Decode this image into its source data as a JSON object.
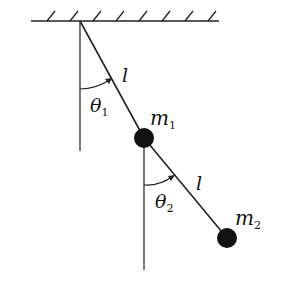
{
  "figure": {
    "colors": {
      "line": "#222222",
      "mass": "#111111",
      "background": "#ffffff"
    },
    "ceiling": {
      "x1": 31,
      "x2": 219,
      "y": 21,
      "hatch_x": [
        47,
        70,
        93,
        116,
        139,
        162,
        185,
        208
      ]
    },
    "pivot": {
      "x": 80,
      "y": 21
    },
    "mass1": {
      "x": 144,
      "y": 138,
      "r": 10
    },
    "mass2": {
      "x": 227,
      "y": 238,
      "r": 10
    },
    "reference_line1": {
      "x": 80,
      "y1": 21,
      "y2": 151
    },
    "reference_line2": {
      "x": 144,
      "y1": 138,
      "y2": 270
    }
  },
  "labels": {
    "length1": "l",
    "length2": "l",
    "theta1_symbol": "θ",
    "theta1_sub": "1",
    "theta2_symbol": "θ",
    "theta2_sub": "2",
    "m1_symbol": "m",
    "m1_sub": "1",
    "m2_symbol": "m",
    "m2_sub": "2"
  }
}
